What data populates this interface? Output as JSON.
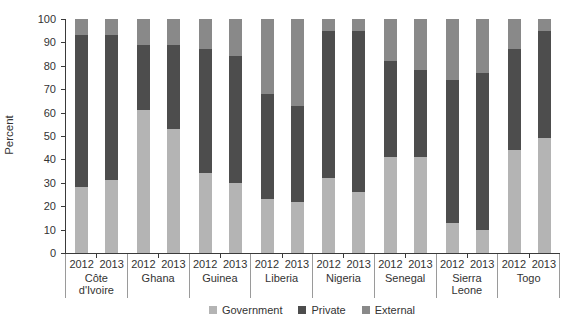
{
  "chart_data": {
    "type": "bar",
    "stacked": true,
    "unit": "percent",
    "title": "",
    "xlabel": "",
    "ylabel": "Percent",
    "ylim": [
      0,
      100
    ],
    "yticks": [
      0,
      10,
      20,
      30,
      40,
      50,
      60,
      70,
      80,
      90,
      100
    ],
    "grid": false,
    "legend_position": "bottom",
    "series_order": [
      "Government",
      "Private",
      "External"
    ],
    "colors": {
      "government": "#b4b4b4",
      "private": "#4d4d4d",
      "external": "#898989",
      "axis": "#3a3a3a",
      "separator": "#9a9a9a",
      "text": "#333333",
      "background": "#ffffff"
    },
    "years": [
      "2012",
      "2013"
    ],
    "groups": [
      {
        "country": "Côte d'Ivoire",
        "bars": [
          {
            "year": "2012",
            "government": 28,
            "private": 65,
            "external": 7
          },
          {
            "year": "2013",
            "government": 31,
            "private": 62,
            "external": 7
          }
        ]
      },
      {
        "country": "Ghana",
        "bars": [
          {
            "year": "2012",
            "government": 61,
            "private": 28,
            "external": 11
          },
          {
            "year": "2013",
            "government": 53,
            "private": 36,
            "external": 11
          }
        ]
      },
      {
        "country": "Guinea",
        "bars": [
          {
            "year": "2012",
            "government": 34,
            "private": 53,
            "external": 13
          },
          {
            "year": "2013",
            "government": 30,
            "private": 54,
            "external": 16
          }
        ]
      },
      {
        "country": "Liberia",
        "bars": [
          {
            "year": "2012",
            "government": 23,
            "private": 45,
            "external": 32
          },
          {
            "year": "2013",
            "government": 22,
            "private": 41,
            "external": 37
          }
        ]
      },
      {
        "country": "Nigeria",
        "bars": [
          {
            "year": "2012",
            "government": 32,
            "private": 63,
            "external": 5
          },
          {
            "year": "2013",
            "government": 26,
            "private": 69,
            "external": 5
          }
        ]
      },
      {
        "country": "Senegal",
        "bars": [
          {
            "year": "2012",
            "government": 41,
            "private": 41,
            "external": 18
          },
          {
            "year": "2013",
            "government": 41,
            "private": 37,
            "external": 22
          }
        ]
      },
      {
        "country": "Sierra Leone",
        "bars": [
          {
            "year": "2012",
            "government": 13,
            "private": 61,
            "external": 26
          },
          {
            "year": "2013",
            "government": 10,
            "private": 67,
            "external": 23
          }
        ]
      },
      {
        "country": "Togo",
        "bars": [
          {
            "year": "2012",
            "government": 44,
            "private": 43,
            "external": 13
          },
          {
            "year": "2013",
            "government": 49,
            "private": 46,
            "external": 5
          }
        ]
      }
    ],
    "legend": [
      {
        "label": "Government",
        "key": "government"
      },
      {
        "label": "Private",
        "key": "private"
      },
      {
        "label": "External",
        "key": "external"
      }
    ]
  }
}
